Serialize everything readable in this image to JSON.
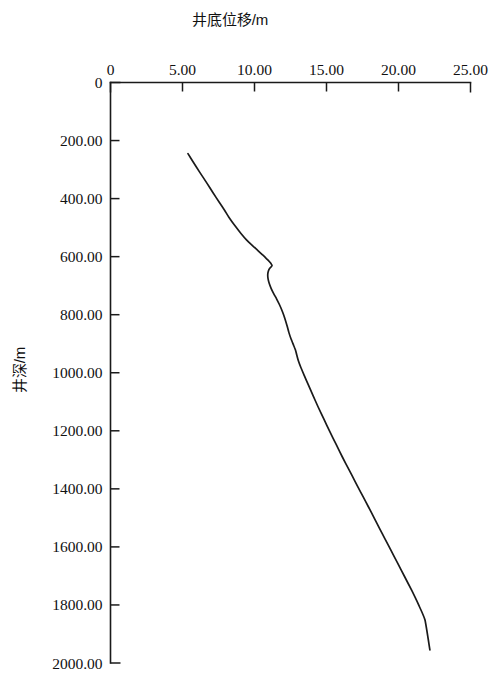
{
  "chart_data": {
    "type": "line",
    "title": "",
    "xlabel": "井底位移/m",
    "ylabel": "井深/m",
    "x_axis_position": "top",
    "y_axis_direction": "down",
    "xlim": [
      0,
      25
    ],
    "ylim": [
      0,
      2000
    ],
    "grid": false,
    "legend": null,
    "x_ticks": [
      {
        "value": 0,
        "label": "0"
      },
      {
        "value": 5,
        "label": "5.00"
      },
      {
        "value": 10,
        "label": "10.00"
      },
      {
        "value": 15,
        "label": "15.00"
      },
      {
        "value": 20,
        "label": "20.00"
      },
      {
        "value": 25,
        "label": "25.00"
      }
    ],
    "y_ticks": [
      {
        "value": 0,
        "label": "0"
      },
      {
        "value": 200,
        "label": "200.00"
      },
      {
        "value": 400,
        "label": "400.00"
      },
      {
        "value": 600,
        "label": "600.00"
      },
      {
        "value": 800,
        "label": "800.00"
      },
      {
        "value": 1000,
        "label": "1000.00"
      },
      {
        "value": 1200,
        "label": "1200.00"
      },
      {
        "value": 1400,
        "label": "1400.00"
      },
      {
        "value": 1600,
        "label": "1600.00"
      },
      {
        "value": 1800,
        "label": "1800.00"
      },
      {
        "value": 2000,
        "label": "2000.00"
      }
    ],
    "series": [
      {
        "name": "井底位移",
        "color": "#1a1a1a",
        "x": [
          5.38,
          5.72,
          6.18,
          6.66,
          7.12,
          7.54,
          7.92,
          8.22,
          8.62,
          9.06,
          9.46,
          9.86,
          10.22,
          10.52,
          10.76,
          10.94,
          11.12,
          11.22,
          11.06,
          10.96,
          10.92,
          10.94,
          11.02,
          11.16,
          11.34,
          11.54,
          11.72,
          11.88,
          12.02,
          12.14,
          12.26,
          12.38,
          12.54,
          12.72,
          12.86,
          12.94,
          13.04,
          13.22,
          13.46,
          13.74,
          14.06,
          14.42,
          14.82,
          15.24,
          15.68,
          16.12,
          16.56,
          16.98,
          17.38,
          17.74,
          18.06,
          18.36,
          18.68,
          19.06,
          19.48,
          19.94,
          20.42,
          20.92,
          21.4,
          21.84,
          22.18
        ],
        "y": [
          245,
          272,
          308,
          344,
          380,
          412,
          440,
          464,
          492,
          520,
          543,
          562,
          578,
          592,
          603,
          612,
          622,
          631,
          640,
          650,
          662,
          676,
          692,
          710,
          728,
          746,
          764,
          782,
          800,
          818,
          838,
          860,
          884,
          906,
          924,
          940,
          958,
          982,
          1010,
          1042,
          1078,
          1118,
          1160,
          1204,
          1248,
          1292,
          1334,
          1374,
          1412,
          1446,
          1476,
          1505,
          1536,
          1572,
          1612,
          1656,
          1702,
          1750,
          1800,
          1852,
          1955
        ]
      }
    ]
  },
  "figure": {
    "background_color": "#ffffff",
    "axis_color": "#1a1a1a",
    "curve_color": "#1a1a1a"
  }
}
